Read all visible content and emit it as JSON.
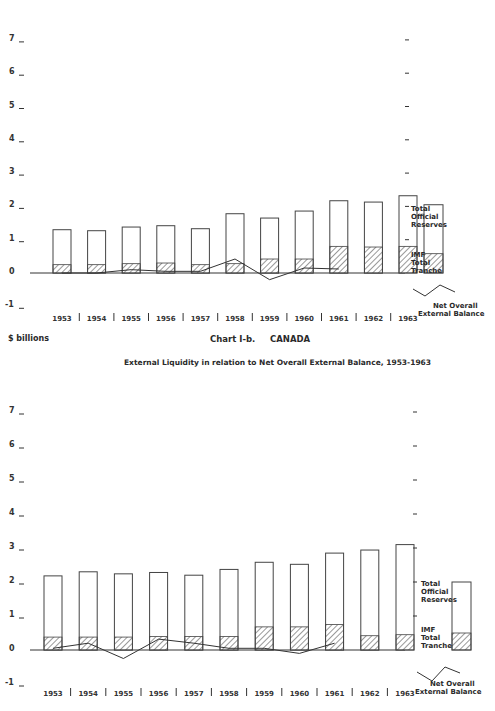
{
  "page": {
    "units_label": "$ billions",
    "chart_title": "Chart I-b.     CANADA",
    "chart_subtitle": "External Liquidity in relation to Net Overall External Balance, 1953-1963"
  },
  "legend": {
    "reserves": "Total Official Reserves",
    "reserves_lines": [
      "Total",
      "Official",
      "Reserves"
    ],
    "imf": "IMF Total Tranche",
    "imf_lines": [
      "IMF",
      "Total",
      "Tranche"
    ],
    "balance": "Net Overall External Balance",
    "balance_lines": [
      "Net Overall",
      "External Balance"
    ]
  },
  "y_ticks": [
    "7",
    "6",
    "5",
    "4",
    "3",
    "2",
    "1",
    "0",
    "-1"
  ],
  "x_ticks": [
    "1953",
    "1954",
    "1955",
    "1956",
    "1957",
    "1958",
    "1959",
    "1960",
    "1961",
    "1962",
    "1963"
  ],
  "chart_data": [
    {
      "type": "bar",
      "title": "(upper chart, title cropped)",
      "xlabel": "",
      "ylabel": "$ billions",
      "ylim": [
        -1,
        7
      ],
      "grid": false,
      "legend_position": "right",
      "categories": [
        "1953",
        "1954",
        "1955",
        "1956",
        "1957",
        "1958",
        "1959",
        "1960",
        "1961",
        "1962",
        "1963"
      ],
      "series": [
        {
          "name": "Total Official Reserves",
          "kind": "bar",
          "values": [
            1.3,
            1.27,
            1.38,
            1.42,
            1.33,
            1.78,
            1.65,
            1.86,
            2.17,
            2.13,
            2.32
          ]
        },
        {
          "name": "IMF Total Tranche",
          "kind": "bar-hatched",
          "values": [
            0.25,
            0.25,
            0.28,
            0.3,
            0.25,
            0.28,
            0.42,
            0.42,
            0.8,
            0.78,
            0.8
          ]
        },
        {
          "name": "Net Overall External Balance",
          "kind": "line",
          "values": [
            0.0,
            0.0,
            0.1,
            0.05,
            0.05,
            0.42,
            -0.2,
            0.15,
            0.12,
            null,
            null
          ]
        }
      ]
    },
    {
      "type": "bar",
      "title": "Chart I-b. CANADA",
      "subtitle": "External Liquidity in relation to Net Overall External Balance, 1953-1963",
      "xlabel": "",
      "ylabel": "$ billions",
      "ylim": [
        -1,
        7
      ],
      "grid": false,
      "legend_position": "right",
      "categories": [
        "1953",
        "1954",
        "1955",
        "1956",
        "1957",
        "1958",
        "1959",
        "1960",
        "1961",
        "1962",
        "1963"
      ],
      "series": [
        {
          "name": "Total Official Reserves",
          "kind": "bar",
          "values": [
            2.18,
            2.3,
            2.24,
            2.28,
            2.2,
            2.37,
            2.58,
            2.52,
            2.85,
            2.94,
            3.1
          ]
        },
        {
          "name": "IMF Total Tranche",
          "kind": "bar-hatched",
          "values": [
            0.38,
            0.38,
            0.38,
            0.4,
            0.4,
            0.4,
            0.68,
            0.68,
            0.75,
            0.42,
            0.45
          ]
        },
        {
          "name": "Net Overall External Balance",
          "kind": "line",
          "values": [
            0.05,
            0.2,
            -0.25,
            0.32,
            0.2,
            0.05,
            0.05,
            -0.1,
            0.2,
            null,
            null
          ]
        }
      ]
    }
  ]
}
